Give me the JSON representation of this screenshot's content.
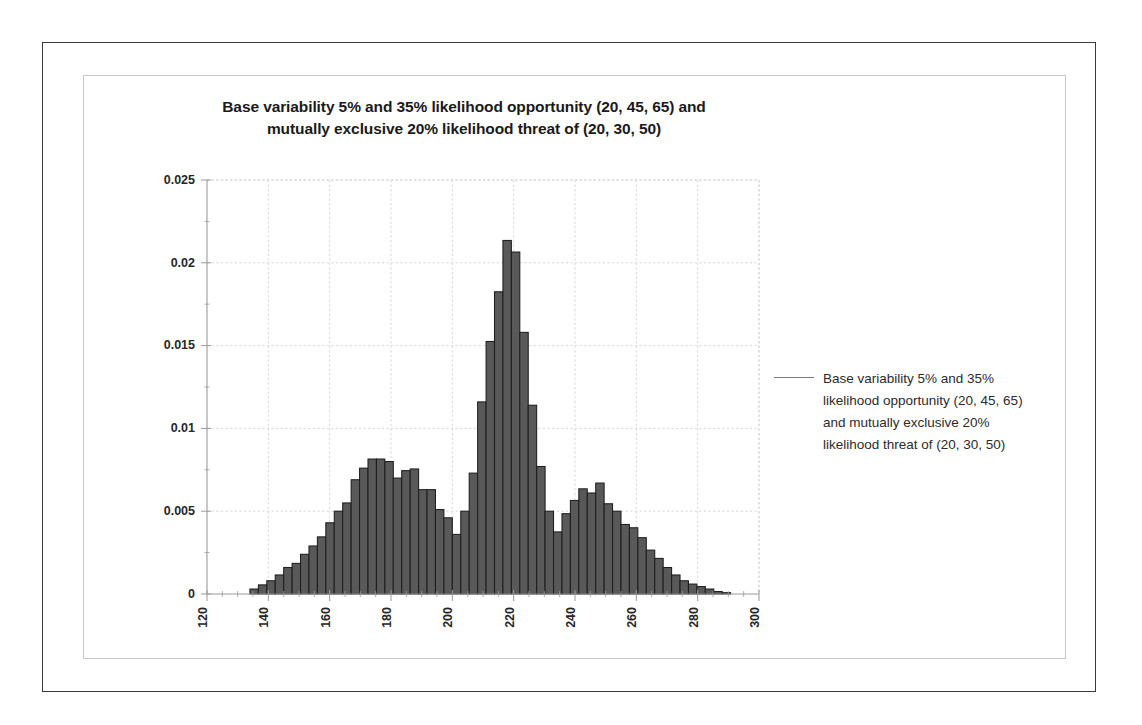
{
  "chart_data": {
    "type": "bar",
    "title_lines": [
      "Base variability 5% and 35% likelihood opportunity (20, 45, 65) and",
      "mutually exclusive  20% likelihood threat of (20, 30, 50)"
    ],
    "title": "Base variability 5% and 35% likelihood opportunity (20, 45, 65) and mutually exclusive  20% likelihood threat of (20, 30, 50)",
    "subtitle": "",
    "xlabel": "",
    "ylabel": "",
    "xlim": [
      120,
      300
    ],
    "ylim": [
      0,
      0.025
    ],
    "xticks": [
      "120",
      "140",
      "160",
      "180",
      "200",
      "220",
      "240",
      "260",
      "280",
      "300"
    ],
    "xtick_values": [
      120,
      140,
      160,
      180,
      200,
      220,
      240,
      260,
      280,
      300
    ],
    "yticks": [
      "0",
      "0.005",
      "0.01",
      "0.015",
      "0.02",
      "0.025"
    ],
    "ytick_values": [
      0,
      0.005,
      0.01,
      0.015,
      0.02,
      0.025
    ],
    "grid": true,
    "grid_axis": "both",
    "bar_fill": "#595959",
    "bar_stroke": "#1e1e1e",
    "bin_width": 2.75,
    "bin_starts": [
      134.0,
      136.75,
      139.5,
      142.25,
      145.0,
      147.75,
      150.5,
      153.25,
      156.0,
      158.75,
      161.5,
      164.25,
      167.0,
      169.75,
      172.5,
      175.25,
      178.0,
      180.75,
      183.5,
      186.25,
      189.0,
      191.75,
      194.5,
      197.25,
      200.0,
      202.75,
      205.5,
      208.25,
      211.0,
      213.75,
      216.5,
      219.25,
      222.0,
      224.75,
      227.5,
      230.25,
      233.0,
      235.75,
      238.5,
      241.25,
      244.0,
      246.75,
      249.5,
      252.25,
      255.0,
      257.75,
      260.5,
      263.25,
      266.0,
      268.75,
      271.5,
      274.25,
      277.0,
      279.75,
      282.5,
      285.25,
      288.0
    ],
    "values": [
      0.0003,
      0.00055,
      0.0008,
      0.00115,
      0.0016,
      0.00185,
      0.0024,
      0.0029,
      0.00345,
      0.0043,
      0.005,
      0.0055,
      0.0069,
      0.0076,
      0.00815,
      0.00815,
      0.008,
      0.007,
      0.00745,
      0.00755,
      0.0063,
      0.0063,
      0.0051,
      0.0046,
      0.0036,
      0.005,
      0.0073,
      0.0116,
      0.01525,
      0.01825,
      0.02135,
      0.02065,
      0.0158,
      0.0114,
      0.0077,
      0.005,
      0.00375,
      0.00485,
      0.00565,
      0.00635,
      0.0061,
      0.0067,
      0.00545,
      0.005,
      0.0042,
      0.004,
      0.0034,
      0.00265,
      0.00215,
      0.0016,
      0.00115,
      0.0008,
      0.0006,
      0.00045,
      0.0003,
      0.00015,
      8e-05
    ],
    "legend": {
      "position": "right",
      "entries": [
        {
          "marker": "line",
          "color": "#7a7a7a",
          "label": "Base variability 5% and 35% likelihood opportunity (20, 45, 65) and mutually exclusive 20% likelihood threat of (20, 30, 50)"
        }
      ]
    }
  },
  "legend_text": "Base variability 5% and 35% likelihood opportunity (20, 45, 65) and mutually exclusive 20% likelihood threat of (20, 30, 50)",
  "title_line_1": "Base variability 5% and 35% likelihood opportunity (20, 45, 65) and",
  "title_line_2": "mutually exclusive  20% likelihood threat of (20, 30, 50)"
}
